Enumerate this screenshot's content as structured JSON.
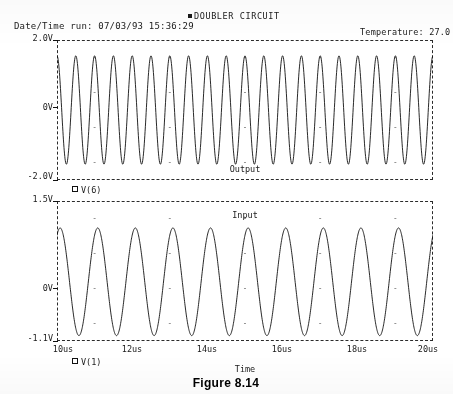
{
  "header": {
    "date_time_run": "Date/Time run: 07/03/93  15:36:29",
    "title": "DOUBLER CIRCUIT",
    "temperature": "Temperature: 27.0"
  },
  "figure": {
    "caption": "Figure 8.14"
  },
  "chart_data": [
    {
      "type": "line",
      "panel": "top",
      "title": "Output",
      "trace_label": "V(6)",
      "xlabel": "Time",
      "ylabel": "",
      "xlim": [
        10,
        20
      ],
      "ylim": [
        -2.0,
        2.0
      ],
      "xunits": "us",
      "yunits": "V",
      "xticks": [
        10,
        12,
        14,
        16,
        18,
        20
      ],
      "xticklabels": [
        "10us",
        "12us",
        "14us",
        "16us",
        "18us",
        "20us"
      ],
      "yticks": [
        2.0,
        0.0,
        -2.0
      ],
      "yticklabels": [
        "2.0V",
        "0V",
        "-2.0V"
      ],
      "grid": "dots",
      "legend": "below-axis",
      "waveform": {
        "shape": "sine",
        "frequency_mhz": 2.0,
        "cycles_visible": 20,
        "amplitude_v": 1.55,
        "offset_v": 0.0,
        "phase_deg": 90
      }
    },
    {
      "type": "line",
      "panel": "bottom",
      "title": "Input",
      "trace_label": "V(1)",
      "xlabel": "Time",
      "ylabel": "",
      "xlim": [
        10,
        20
      ],
      "ylim": [
        -1.1,
        1.5
      ],
      "xunits": "us",
      "yunits": "V",
      "xticks": [
        10,
        12,
        14,
        16,
        18,
        20
      ],
      "xticklabels": [
        "10us",
        "12us",
        "14us",
        "16us",
        "18us",
        "20us"
      ],
      "yticks": [
        1.5,
        0.0,
        -1.1
      ],
      "yticklabels": [
        "1.5V",
        "0V",
        "-1.1V"
      ],
      "grid": "dots",
      "legend": "below-axis",
      "waveform": {
        "shape": "sine",
        "frequency_mhz": 1.0,
        "cycles_visible": 10,
        "amplitude_v": 1.0,
        "offset_v": 0.0,
        "phase_deg": 60
      }
    }
  ],
  "axis_labels": {
    "time": "Time",
    "top_y_max": "2.0V",
    "top_y_mid": "0V",
    "top_y_min": "-2.0V",
    "bot_y_max": "1.5V",
    "bot_y_mid": "0V",
    "bot_y_min": "-1.1V",
    "x0": "10us",
    "x1": "12us",
    "x2": "14us",
    "x3": "16us",
    "x4": "18us",
    "x5": "20us"
  },
  "plot_labels": {
    "output": "Output",
    "input": "Input"
  },
  "legends": {
    "top": "V(6)",
    "bottom": "V(1)"
  }
}
